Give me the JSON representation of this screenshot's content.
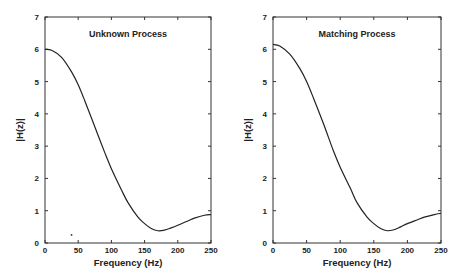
{
  "chart_data": [
    {
      "type": "line",
      "title": "Unknown Process",
      "xlabel": "Frequency (Hz)",
      "ylabel": "|H(z)|",
      "xlim": [
        0,
        250
      ],
      "ylim": [
        0,
        7
      ],
      "xticks": [
        "0",
        "50",
        "100",
        "150",
        "200",
        "250"
      ],
      "yticks": [
        "0",
        "1",
        "2",
        "3",
        "4",
        "5",
        "6",
        "7"
      ],
      "grid": false,
      "series": [
        {
          "name": "|H(z)|",
          "x": [
            0,
            10,
            25,
            40,
            50,
            60,
            75,
            90,
            100,
            115,
            125,
            140,
            150,
            160,
            170,
            180,
            190,
            200,
            215,
            225,
            240,
            250
          ],
          "values": [
            6.0,
            5.97,
            5.75,
            5.3,
            4.9,
            4.4,
            3.6,
            2.8,
            2.3,
            1.65,
            1.25,
            0.8,
            0.6,
            0.45,
            0.38,
            0.4,
            0.47,
            0.55,
            0.68,
            0.77,
            0.86,
            0.88
          ]
        }
      ],
      "annotations": [
        "small dot near (40, 0.25)"
      ]
    },
    {
      "type": "line",
      "title": "Matching Process",
      "xlabel": "Frequency (Hz)",
      "ylabel": "|H(z)|",
      "xlim": [
        0,
        250
      ],
      "ylim": [
        0,
        7
      ],
      "xticks": [
        "0",
        "50",
        "100",
        "150",
        "200",
        "250"
      ],
      "yticks": [
        "0",
        "1",
        "2",
        "3",
        "4",
        "5",
        "6",
        "7"
      ],
      "grid": false,
      "series": [
        {
          "name": "|H(z)|",
          "x": [
            0,
            10,
            25,
            40,
            50,
            60,
            75,
            90,
            100,
            115,
            125,
            140,
            150,
            160,
            170,
            180,
            190,
            200,
            215,
            225,
            240,
            250
          ],
          "values": [
            6.15,
            6.1,
            5.85,
            5.4,
            5.0,
            4.5,
            3.7,
            2.85,
            2.35,
            1.7,
            1.25,
            0.8,
            0.6,
            0.45,
            0.38,
            0.41,
            0.5,
            0.6,
            0.72,
            0.8,
            0.88,
            0.92
          ]
        }
      ]
    }
  ]
}
